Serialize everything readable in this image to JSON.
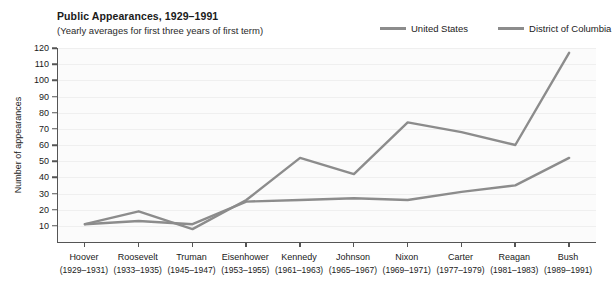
{
  "header": {
    "title": "Public Appearances, 1929–1991",
    "subtitle": "(Yearly averages for first three years of first term)"
  },
  "legend": {
    "position": "top-right",
    "items": [
      {
        "label": "United States",
        "color": "#8c8c8c"
      },
      {
        "label": "District of Columbia",
        "color": "#8c8c8c"
      }
    ]
  },
  "chart_data": {
    "type": "line",
    "title": "Public Appearances, 1929–1991",
    "subtitle": "(Yearly averages for first three years of first term)",
    "xlabel": "",
    "ylabel": "Number of appearances",
    "ylim": [
      0,
      120
    ],
    "yticks": [
      10,
      20,
      30,
      40,
      50,
      60,
      70,
      80,
      90,
      100,
      110,
      120
    ],
    "grid": true,
    "categories": [
      "Hoover",
      "Roosevelt",
      "Truman",
      "Eisenhower",
      "Kennedy",
      "Johnson",
      "Nixon",
      "Carter",
      "Reagan",
      "Bush"
    ],
    "category_years": [
      "(1929–1931)",
      "(1933–1935)",
      "(1945–1947)",
      "(1953–1955)",
      "(1961–1963)",
      "(1965–1967)",
      "(1969–1971)",
      "(1977–1979)",
      "(1981–1983)",
      "(1989–1991)"
    ],
    "series": [
      {
        "name": "United States",
        "color": "#8c8c8c",
        "values": [
          11,
          13,
          11,
          25,
          26,
          27,
          26,
          31,
          35,
          52
        ]
      },
      {
        "name": "District of Columbia",
        "color": "#8c8c8c",
        "values": [
          11,
          19,
          8,
          26,
          52,
          42,
          74,
          68,
          60,
          117
        ]
      }
    ]
  }
}
